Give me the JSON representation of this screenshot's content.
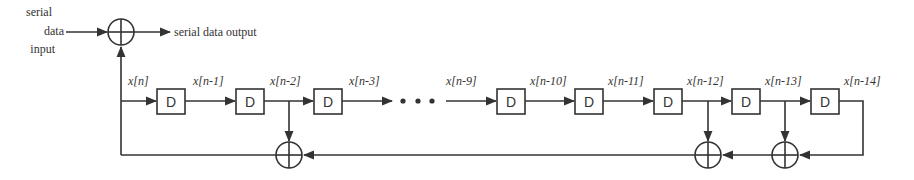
{
  "diagram": {
    "type": "LFSR scrambler (serial feedback shift register)",
    "input_label": [
      "serial",
      "data",
      "input"
    ],
    "output_label": "serial data output",
    "delay_label": "D",
    "ellipsis": "• • •",
    "taps": [
      {
        "id": "x0",
        "label": "x[n]"
      },
      {
        "id": "x1",
        "label": "x[n-1]"
      },
      {
        "id": "x2",
        "label": "x[n-2]"
      },
      {
        "id": "x3",
        "label": "x[n-3]"
      },
      {
        "id": "x9",
        "label": "x[n-9]"
      },
      {
        "id": "x10",
        "label": "x[n-10]"
      },
      {
        "id": "x11",
        "label": "x[n-11]"
      },
      {
        "id": "x12",
        "label": "x[n-12]"
      },
      {
        "id": "x13",
        "label": "x[n-13]"
      },
      {
        "id": "x14",
        "label": "x[n-14]"
      }
    ],
    "feedback_taps": [
      "x[n-2]",
      "x[n-12]",
      "x[n-13]",
      "x[n-14]"
    ],
    "colors": {
      "stroke": "#333333",
      "background": "#ffffff"
    }
  }
}
